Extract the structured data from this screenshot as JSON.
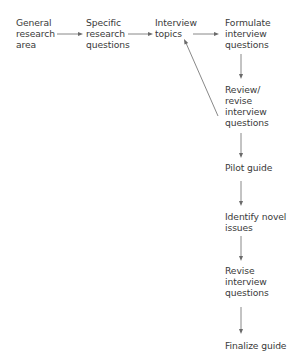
{
  "diagram": {
    "type": "flowchart",
    "nodes": [
      {
        "id": "general",
        "label": "General\nresearch\narea"
      },
      {
        "id": "specific",
        "label": "Specific\nresearch\nquestions"
      },
      {
        "id": "topics",
        "label": "Interview\ntopics"
      },
      {
        "id": "formulate",
        "label": "Formulate\ninterview\nquestions"
      },
      {
        "id": "review",
        "label": "Review/\nrevise\ninterview\nquestions"
      },
      {
        "id": "pilot",
        "label": "Pilot guide"
      },
      {
        "id": "identify",
        "label": "Identify novel\nissues"
      },
      {
        "id": "revise",
        "label": "Revise\ninterview\nquestions"
      },
      {
        "id": "finalize",
        "label": "Finalize guide"
      }
    ],
    "edges": [
      {
        "from": "general",
        "to": "specific"
      },
      {
        "from": "specific",
        "to": "topics"
      },
      {
        "from": "topics",
        "to": "formulate"
      },
      {
        "from": "formulate",
        "to": "review"
      },
      {
        "from": "review",
        "to": "topics"
      },
      {
        "from": "review",
        "to": "pilot"
      },
      {
        "from": "pilot",
        "to": "identify"
      },
      {
        "from": "identify",
        "to": "revise"
      },
      {
        "from": "revise",
        "to": "finalize"
      }
    ],
    "colors": {
      "text": "#3a3a3a",
      "arrow": "#6a6a6a",
      "background": "#ffffff"
    }
  }
}
